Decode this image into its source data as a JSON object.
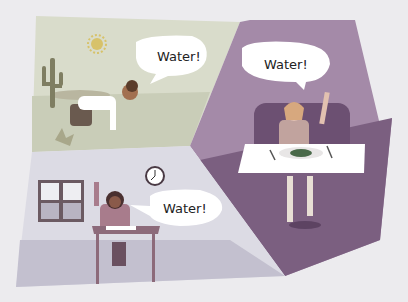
{
  "scene": {
    "description": "Three panels of people asking for water",
    "colors": {
      "background": "#ecebee",
      "desert_sky": "#d9dccb",
      "desert_ground": "#c9cdb8",
      "restaurant_wall": "#a48aa8",
      "restaurant_floor": "#7b5f80",
      "classroom_wall": "#dcdbe4",
      "classroom_floor": "#c3c0cf",
      "bubble": "#ffffff"
    }
  },
  "panels": [
    {
      "name": "desert",
      "speech": "Water!"
    },
    {
      "name": "restaurant",
      "speech": "Water!"
    },
    {
      "name": "classroom",
      "speech": "Water!"
    }
  ]
}
